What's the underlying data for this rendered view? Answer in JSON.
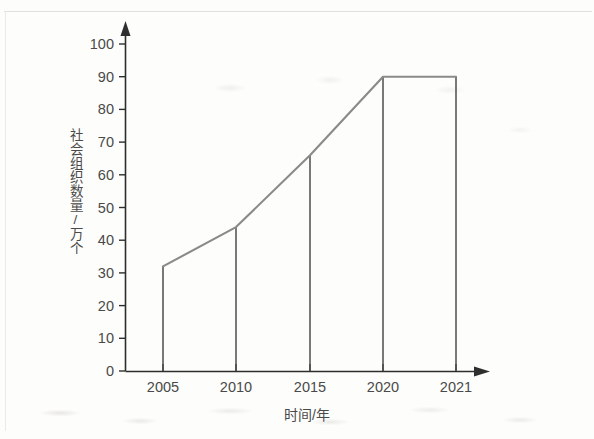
{
  "chart_data": {
    "type": "line",
    "title": "",
    "subtitle": "",
    "xlabel": "时间/年",
    "ylabel": "社会组织数量/万个",
    "categories": [
      "2005",
      "2010",
      "2015",
      "2020",
      "2021"
    ],
    "values": [
      32,
      44,
      66,
      90,
      90
    ],
    "series": [
      {
        "name": "社会组织数量",
        "values": [
          32,
          44,
          66,
          90,
          90
        ]
      }
    ],
    "x": [
      2005,
      2010,
      2015,
      2020,
      2021
    ],
    "xlim": [
      2005,
      2021
    ],
    "ylim": [
      0,
      100
    ],
    "y_ticks": [
      0,
      10,
      20,
      30,
      40,
      50,
      60,
      70,
      80,
      90,
      100
    ],
    "y_tick_labels": [
      "0",
      "10",
      "20",
      "30",
      "40",
      "50",
      "60",
      "70",
      "80",
      "90",
      "100"
    ],
    "x_ticks": [
      2005,
      2010,
      2015,
      2020,
      2021
    ],
    "x_tick_labels": [
      "2005",
      "2010",
      "2015",
      "2020",
      "2021"
    ],
    "grid": false,
    "legend": false,
    "legend_position": "none",
    "drop_lines": true,
    "axis_arrows": true,
    "annotations": [],
    "colors": {
      "line": "#8a8a8a",
      "drop_line": "#4d4d4d",
      "axis": "#2e2e2e",
      "text": "#4a4a4a",
      "background": "#fdfdfb"
    }
  }
}
